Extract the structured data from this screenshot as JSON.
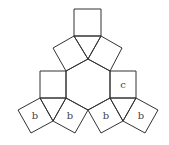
{
  "diagram": {
    "stroke_color": "#333333",
    "label_color": "#444444",
    "background": "#ffffff",
    "hexagon": {
      "points": "66,71 88,59 110,71 110,98 88,110 66,98"
    },
    "squares": [
      {
        "id": "top",
        "points": "74,9 101,9 101,36 74,36",
        "label": ""
      },
      {
        "id": "upper-left-tilted",
        "points": "74,36 53,48 66,71 88,59",
        "label": ""
      },
      {
        "id": "upper-right-tilted",
        "points": "101,36 122,48 110,71 88,59",
        "label": ""
      },
      {
        "id": "middle-left",
        "points": "40,71 66,71 66,98 40,98",
        "label": ""
      },
      {
        "id": "middle-right",
        "points": "110,71 136,71 136,98 110,98",
        "label": "c"
      },
      {
        "id": "bottom-1",
        "points": "40,98 18,110 31,133 53,121",
        "label": "b"
      },
      {
        "id": "bottom-2",
        "points": "66,98 88,110 75,133 53,121",
        "label": "b"
      },
      {
        "id": "bottom-3",
        "points": "110,98 88,110 101,133 123,121",
        "label": "b"
      },
      {
        "id": "bottom-4",
        "points": "136,98 158,110 145,133 123,121",
        "label": "b"
      }
    ],
    "triangles": [
      {
        "id": "top-triangle",
        "points": "74,36 101,36 88,59"
      },
      {
        "id": "left-triangle",
        "points": "40,98 66,98 53,121"
      },
      {
        "id": "right-triangle",
        "points": "110,98 136,98 123,121"
      }
    ],
    "labels": [
      {
        "text": "c",
        "x": 123,
        "y": 88
      },
      {
        "text": "b",
        "x": 35,
        "y": 119
      },
      {
        "text": "b",
        "x": 70,
        "y": 119
      },
      {
        "text": "b",
        "x": 106,
        "y": 119
      },
      {
        "text": "b",
        "x": 141,
        "y": 119
      }
    ]
  }
}
